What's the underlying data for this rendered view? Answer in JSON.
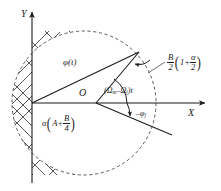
{
  "figure": {
    "type": "vector-phasor-diagram",
    "background": "#ffffff",
    "stroke": "#1b1b1b",
    "axes": {
      "x_label": "X",
      "y_label": "Y",
      "origin_label": "O"
    },
    "labels": {
      "phi_of_t": "φ(t)",
      "angle_omega": {
        "open": "(",
        "omega_m": "Ω",
        "sub_m": "m",
        "minus": "–",
        "omega_j": "Ω",
        "sub_j": "j",
        "close": ")",
        "t": "t",
        "full": "(Ωm–Ωj)t"
      },
      "neg_phi_j": {
        "sign": "–",
        "symbol": "φ",
        "sub": "j",
        "full": "–φj"
      },
      "radius_expr": {
        "num": "B",
        "den": "2",
        "open": "(",
        "one_plus": "1+",
        "alpha": "α",
        "alpha_den": "2",
        "close": ")",
        "full": "B/2 (1 + α/2)"
      },
      "alpha_expr": {
        "alpha": "α",
        "open": "(",
        "A": "A",
        "plus": "+",
        "num": "B",
        "den": "4",
        "close": ")",
        "full": "α(A + B/4)"
      }
    },
    "circle": {
      "cx": 84,
      "cy": 103,
      "r": 72,
      "style": "dashed"
    },
    "hatch_region": {
      "description": "cross-hatched left segment of circle bounded by Y axis"
    }
  }
}
